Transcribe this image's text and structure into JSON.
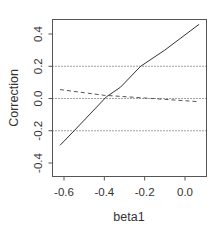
{
  "chart_data": {
    "type": "line",
    "title": "",
    "xlabel": "beta1",
    "ylabel": "Correction",
    "xlim": [
      -0.64,
      0.1
    ],
    "ylim": [
      -0.48,
      0.5
    ],
    "grid": false,
    "x_ticks": [
      -0.6,
      -0.4,
      -0.2,
      0.0
    ],
    "x_tick_labels": [
      "-0.6",
      "-0.4",
      "-0.2",
      "0.0"
    ],
    "y_ticks": [
      -0.4,
      -0.2,
      0.0,
      0.2,
      0.4
    ],
    "y_tick_labels": [
      "-0.4",
      "-0.2",
      "0.0",
      "0.2",
      "0.4"
    ],
    "reference_lines": [
      {
        "y": 0.2,
        "style": "dotted"
      },
      {
        "y": 0.0,
        "style": "dotted"
      },
      {
        "y": -0.2,
        "style": "dotted"
      }
    ],
    "series": [
      {
        "name": "solid",
        "style": "solid",
        "x": [
          -0.62,
          -0.55,
          -0.39,
          -0.32,
          -0.22,
          -0.1,
          0.07
        ],
        "y": [
          -0.29,
          -0.2,
          0.01,
          0.07,
          0.2,
          0.3,
          0.46
        ]
      },
      {
        "name": "dashed",
        "style": "dashed",
        "x": [
          -0.62,
          -0.4,
          -0.2,
          0.07
        ],
        "y": [
          0.055,
          0.02,
          0.003,
          -0.02
        ]
      }
    ]
  }
}
